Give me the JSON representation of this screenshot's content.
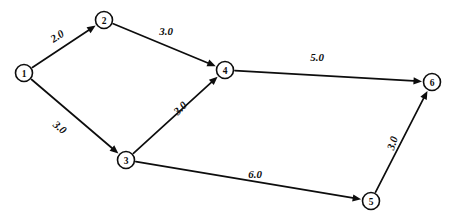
{
  "diagram": {
    "background_color": "#ffffff",
    "stroke_color": "#0d0d0d",
    "node_radius": 8.5
  },
  "chart_data": {
    "type": "diagram",
    "subtype": "directed-weighted-graph",
    "title": "",
    "nodes": [
      {
        "id": "1",
        "label": "1",
        "x": 24,
        "y": 73
      },
      {
        "id": "2",
        "label": "2",
        "x": 104,
        "y": 20
      },
      {
        "id": "3",
        "label": "3",
        "x": 126,
        "y": 160
      },
      {
        "id": "4",
        "label": "4",
        "x": 225,
        "y": 70
      },
      {
        "id": "5",
        "label": "5",
        "x": 371,
        "y": 201
      },
      {
        "id": "6",
        "label": "6",
        "x": 432,
        "y": 82
      }
    ],
    "edges": [
      {
        "from": "1",
        "to": "2",
        "weight": "2.0",
        "label_x": 57,
        "label_y": 36,
        "label_rotation": -33
      },
      {
        "from": "2",
        "to": "4",
        "weight": "3.0",
        "label_x": 166,
        "label_y": 31,
        "label_rotation": 0
      },
      {
        "from": "1",
        "to": "3",
        "weight": "3.0",
        "label_x": 60,
        "label_y": 127,
        "label_rotation": 40
      },
      {
        "from": "3",
        "to": "4",
        "weight": "3.0",
        "label_x": 180,
        "label_y": 108,
        "label_rotation": -45
      },
      {
        "from": "4",
        "to": "6",
        "weight": "5.0",
        "label_x": 317,
        "label_y": 57,
        "label_rotation": 0
      },
      {
        "from": "3",
        "to": "5",
        "weight": "6.0",
        "label_x": 255,
        "label_y": 174,
        "label_rotation": 0
      },
      {
        "from": "5",
        "to": "6",
        "weight": "3.0",
        "label_x": 392,
        "label_y": 143,
        "label_rotation": -72
      }
    ]
  }
}
